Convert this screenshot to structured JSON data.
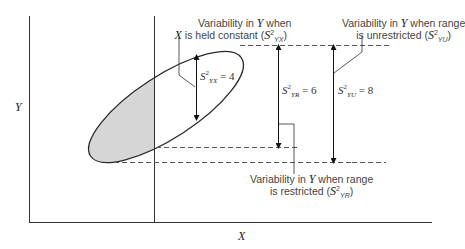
{
  "diagram": {
    "type": "range-restriction-variance-diagram",
    "axes": {
      "x_label": "X",
      "y_label": "Y"
    },
    "annotations": {
      "held_constant": {
        "line1": "Variability in ",
        "line1_var": "Y",
        "line1_end": " when",
        "line2_var": "X",
        "line2": " is held constant (",
        "symbol": "S",
        "sup": "2",
        "sub": "YX",
        "close": ")"
      },
      "unrestricted": {
        "line1": "Variability in ",
        "line1_var": "Y",
        "line1_end": " when range",
        "line2": "is unrestricted (",
        "symbol": "S",
        "sup": "2",
        "sub": "YU",
        "close": ")"
      },
      "restricted": {
        "line1": "Variability in ",
        "line1_var": "Y",
        "line1_end": " when range",
        "line2": "is restricted (",
        "symbol": "S",
        "sup": "2",
        "sub": "YR",
        "close": ")"
      }
    },
    "measures": {
      "syx": {
        "symbol": "S",
        "sup": "2",
        "sub": "YX",
        "eq": " = 4"
      },
      "syr": {
        "symbol": "S",
        "sup": "2",
        "sub": "YR",
        "eq": " = 6"
      },
      "syu": {
        "symbol": "S",
        "sup": "2",
        "sub": "YU",
        "eq": " = 8"
      }
    },
    "colors": {
      "line": "#2a2a2a",
      "shade": "#d8d8d8",
      "dash": "#555555"
    }
  }
}
